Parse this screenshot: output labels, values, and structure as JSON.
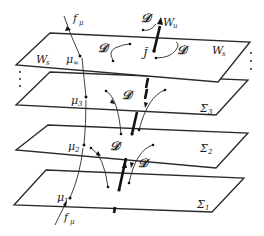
{
  "diagram": {
    "planes": [
      {
        "id": "Ws",
        "label": "W",
        "label_sub": "s",
        "left_label": "W",
        "left_label_sub": "s",
        "corners": [
          [
            50,
            33
          ],
          [
            250,
            42
          ],
          [
            218,
            82
          ],
          [
            16,
            65
          ]
        ]
      },
      {
        "id": "Sigma3",
        "label": "Σ",
        "label_sub": "3",
        "corners": [
          [
            50,
            72
          ],
          [
            248,
            80
          ],
          [
            216,
            115
          ],
          [
            16,
            105
          ]
        ]
      },
      {
        "id": "Sigma2",
        "label": "Σ",
        "label_sub": "2",
        "corners": [
          [
            48,
            125
          ],
          [
            248,
            133
          ],
          [
            216,
            168
          ],
          [
            16,
            150
          ]
        ]
      },
      {
        "id": "Sigma1",
        "label": "Σ",
        "label_sub": "1",
        "corners": [
          [
            46,
            170
          ],
          [
            244,
            178
          ],
          [
            212,
            212
          ],
          [
            14,
            205
          ]
        ]
      }
    ],
    "points": [
      {
        "id": "mu_inf",
        "label": "μ",
        "label_sub": "∞"
      },
      {
        "id": "mu3",
        "label": "μ",
        "label_sub": "3"
      },
      {
        "id": "mu2",
        "label": "μ",
        "label_sub": "2"
      },
      {
        "id": "mu1",
        "label": "μ",
        "label_sub": "1"
      }
    ],
    "labels": {
      "f_mu_top": {
        "main": "f",
        "sub": "μ"
      },
      "f_mu_bottom": {
        "main": "f",
        "sub": "μ"
      },
      "W_u": {
        "main": "W",
        "sub": "u"
      },
      "J": "J̃",
      "D": "𝒟"
    },
    "ellipsis": "⋮"
  }
}
